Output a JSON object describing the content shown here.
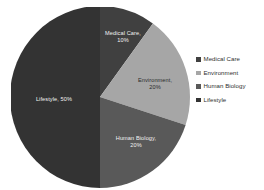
{
  "chart_data": {
    "type": "pie",
    "title": "",
    "subtitle": "",
    "xlabel": "",
    "ylabel": "",
    "grid": false,
    "legend_position": "right",
    "start_angle_deg": 0,
    "direction": "clockwise",
    "categories": [
      "Medical Care",
      "Environment",
      "Human Biology",
      "Lifestyle"
    ],
    "values": [
      10,
      20,
      20,
      50
    ],
    "value_unit": "%",
    "colors": [
      "#404040",
      "#a6a6a6",
      "#595959",
      "#333333"
    ],
    "slices": [
      {
        "name": "Medical Care",
        "value": 10,
        "percent_text": "10%",
        "label_text": "Medical Care,",
        "color": "#404040",
        "label_color": "#f2f2f2"
      },
      {
        "name": "Environment",
        "value": 20,
        "percent_text": "20%",
        "label_text": "Environment,",
        "color": "#a6a6a6",
        "label_color": "#2b2b2b"
      },
      {
        "name": "Human Biology",
        "value": 20,
        "percent_text": "20%",
        "label_text": "Human Biology,",
        "color": "#595959",
        "label_color": "#f2f2f2"
      },
      {
        "name": "Lifestyle",
        "value": 50,
        "percent_text": "50%",
        "label_text": "Lifestyle,",
        "color": "#333333",
        "label_color": "#f2f2f2"
      }
    ],
    "legend": [
      {
        "label": "Medical Care",
        "color": "#404040"
      },
      {
        "label": "Environment",
        "color": "#a6a6a6"
      },
      {
        "label": "Human Biology",
        "color": "#595959"
      },
      {
        "label": "Lifestyle",
        "color": "#333333"
      }
    ]
  }
}
